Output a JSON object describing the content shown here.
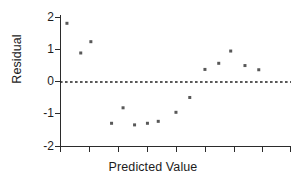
{
  "chart_data": {
    "type": "scatter",
    "title": "",
    "subtitle": "",
    "xlabel": "Predicted Value",
    "ylabel": "Residual",
    "ylim": [
      -2,
      2
    ],
    "yticks": [
      2,
      1,
      0,
      -1,
      -2
    ],
    "ytick_labels": [
      "2",
      "1",
      "0",
      "-1",
      "-2"
    ],
    "xlim": [
      0,
      10
    ],
    "xticks": [
      0,
      1.25,
      2.5,
      3.75,
      5,
      6.25,
      7.5,
      8.75,
      10
    ],
    "xtick_labels": [
      "",
      "",
      "",
      "",
      "",
      "",
      "",
      "",
      ""
    ],
    "grid": false,
    "legend": null,
    "annotations": [
      {
        "kind": "reference-line",
        "orientation": "horizontal",
        "y": 0,
        "style": "dashed",
        "label": "zero residual line"
      }
    ],
    "points": [
      {
        "x": 0.28,
        "y": 1.82
      },
      {
        "x": 0.88,
        "y": 0.9
      },
      {
        "x": 1.32,
        "y": 1.25
      },
      {
        "x": 2.22,
        "y": -1.28
      },
      {
        "x": 2.72,
        "y": -0.8
      },
      {
        "x": 3.22,
        "y": -1.33
      },
      {
        "x": 3.78,
        "y": -1.28
      },
      {
        "x": 4.25,
        "y": -1.22
      },
      {
        "x": 5.02,
        "y": -0.94
      },
      {
        "x": 5.62,
        "y": -0.48
      },
      {
        "x": 6.28,
        "y": 0.39
      },
      {
        "x": 6.88,
        "y": 0.58
      },
      {
        "x": 7.4,
        "y": 0.96
      },
      {
        "x": 8.02,
        "y": 0.51
      },
      {
        "x": 8.62,
        "y": 0.38
      }
    ],
    "series": [
      {
        "name": "residuals",
        "marker": "square",
        "color": "#585858",
        "marker_size_px": 3
      }
    ]
  },
  "colors": {
    "background": "#ffffff",
    "axis": "#2b2b2b",
    "marker": "#585858",
    "text": "#1c1c1c",
    "zero_line": "#222222"
  }
}
